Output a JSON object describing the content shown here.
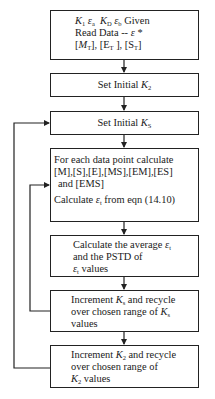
{
  "flowchart": {
    "box1": {
      "line1": {
        "k1": "K",
        "k1_sub": "1",
        "ea": "ε",
        "ea_sub": "a",
        "kd": "K",
        "kd_sub": "D",
        "eb": "ε",
        "eb_sub": "b",
        "tail": "Given"
      },
      "line2": {
        "text": "Read Data -- ",
        "eps": "ε",
        "star": " *"
      },
      "line3": {
        "mt_open": "[",
        "mt": "M",
        "mt_sub": "T",
        "mt_close": "], ",
        "et": "[E",
        "et_sub": "T",
        "et_close": " ], ",
        "st": "[S",
        "st_sub": "T",
        "st_close": "]"
      }
    },
    "box2": {
      "text": "Set Initial ",
      "k": "K",
      "k_sub": "2"
    },
    "box3": {
      "text": "Set Initial ",
      "k": "K",
      "k_sub": "S"
    },
    "box4": {
      "line1": "For each data point calculate",
      "line2": "[M],[S],[E],[MS],[EM],[ES]",
      "line3": "and [EMS]",
      "line4_pre": "Calculate ",
      "line4_eps": "ε",
      "line4_sub": "t",
      "line4_post": " from eqn (14.10)"
    },
    "box5": {
      "line1_pre": "Calculate the average ",
      "line1_eps": "ε",
      "line1_sub": "t",
      "line2": "and the PSTD of",
      "line3_eps": "ε",
      "line3_sub": "t",
      "line3_post": " values"
    },
    "box6": {
      "line1_pre": "Increment ",
      "line1_k": "K",
      "line1_sub": "s",
      "line1_post": " and recycle",
      "line2_pre": "over chosen range of ",
      "line2_k": "K",
      "line2_sub": "s",
      "line3": "values"
    },
    "box7": {
      "line1_pre": "Increment ",
      "line1_k": "K",
      "line1_sub": "2",
      "line1_post": " and recycle",
      "line2": "over chosen range of",
      "line3_k": "K",
      "line3_sub": "2",
      "line3_post": " values"
    }
  }
}
